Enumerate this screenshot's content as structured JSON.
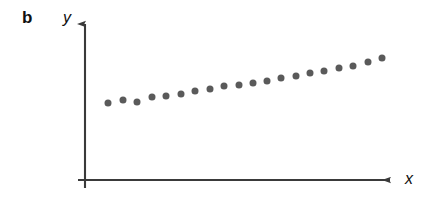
{
  "figure": {
    "panel_label": "b",
    "background_color": "#ffffff",
    "width": 434,
    "height": 210
  },
  "axes": {
    "x_label": "x",
    "y_label": "y",
    "axis_color": "#3a3a3a",
    "x_axis_y": 180,
    "y_axis_x": 85,
    "x_axis_start": 78,
    "x_axis_end": 398,
    "y_axis_top": 16,
    "y_axis_bottom": 188,
    "arrowheads": true,
    "ticks": false,
    "gridlines": false
  },
  "chart_data": {
    "type": "scatter",
    "title": "",
    "subtitle": "",
    "xlabel": "x",
    "ylabel": "y",
    "panel": "b",
    "grid": false,
    "legend": null,
    "marker": {
      "shape": "circle",
      "color": "#5a5a5a",
      "diameter_px": 7
    },
    "n_points": 20,
    "xlim": [
      85,
      398
    ],
    "ylim": [
      180,
      16
    ],
    "x": [
      108,
      123,
      137,
      152,
      166,
      181,
      195,
      210,
      224,
      239,
      253,
      267,
      281,
      296,
      310,
      324,
      339,
      353,
      368,
      382
    ],
    "y": [
      103,
      100,
      102,
      97,
      96,
      94,
      91,
      89,
      86,
      85,
      83,
      81,
      78,
      76,
      73,
      71,
      68,
      66,
      62,
      58
    ],
    "series": [
      {
        "name": "data",
        "color": "#5a5a5a",
        "points": [
          [
            108,
            103
          ],
          [
            123,
            100
          ],
          [
            137,
            102
          ],
          [
            152,
            97
          ],
          [
            166,
            96
          ],
          [
            181,
            94
          ],
          [
            195,
            91
          ],
          [
            210,
            89
          ],
          [
            224,
            86
          ],
          [
            239,
            85
          ],
          [
            253,
            83
          ],
          [
            267,
            81
          ],
          [
            281,
            78
          ],
          [
            296,
            76
          ],
          [
            310,
            73
          ],
          [
            324,
            71
          ],
          [
            339,
            68
          ],
          [
            353,
            66
          ],
          [
            368,
            62
          ],
          [
            382,
            58
          ]
        ]
      }
    ]
  }
}
